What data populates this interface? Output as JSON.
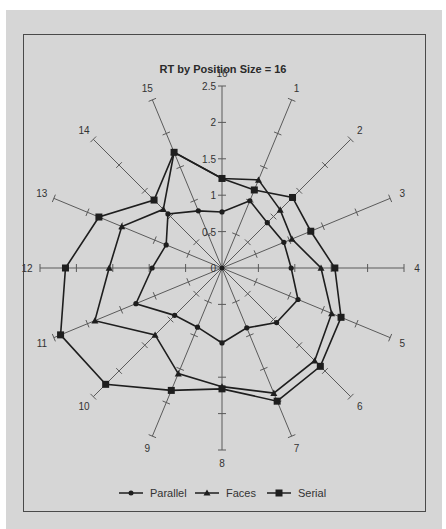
{
  "chart_data": {
    "type": "radar",
    "title": "RT by Position Size = 16",
    "categories": [
      "1",
      "2",
      "3",
      "4",
      "5",
      "6",
      "7",
      "8",
      "9",
      "10",
      "11",
      "12",
      "13",
      "14",
      "15",
      "16"
    ],
    "radial_ticks": [
      "0",
      "0.5",
      "1",
      "1.5",
      "2",
      "2.5"
    ],
    "rlim": [
      0,
      2.5
    ],
    "grid": false,
    "legend_position": "bottom",
    "series": [
      {
        "name": "Parallel",
        "marker": "circle",
        "values": [
          1.0,
          0.88,
          0.92,
          0.95,
          1.13,
          1.06,
          0.89,
          1.03,
          0.88,
          0.92,
          1.28,
          0.96,
          0.83,
          1.05,
          0.85,
          0.77
        ]
      },
      {
        "name": "Faces",
        "marker": "triangle",
        "values": [
          1.31,
          1.13,
          1.04,
          1.36,
          1.63,
          1.8,
          1.86,
          1.63,
          1.57,
          1.3,
          1.89,
          1.55,
          1.49,
          1.14,
          1.72,
          1.23
        ]
      },
      {
        "name": "Serial",
        "marker": "square",
        "values": [
          1.16,
          1.37,
          1.32,
          1.55,
          1.77,
          1.91,
          1.98,
          1.66,
          1.82,
          2.26,
          2.4,
          2.15,
          1.83,
          1.32,
          1.72,
          1.23
        ]
      }
    ]
  },
  "colors": {
    "background": "#d6d6d6",
    "frame": "#4a4a4a",
    "axis": "#5a5a5a",
    "series": "#1e1e1e"
  }
}
